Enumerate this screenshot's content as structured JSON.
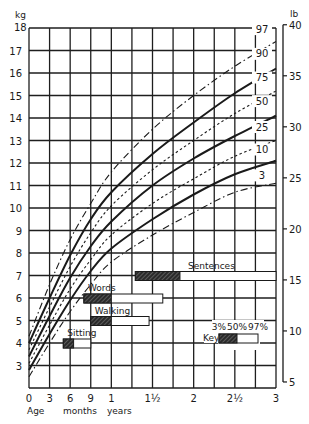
{
  "chart_data": {
    "type": "line",
    "title": "",
    "xlabel": "Age months years",
    "ylabel_left": "kg",
    "ylabel_right": "lb",
    "x_unit": "months",
    "xlim": [
      0,
      36
    ],
    "ylim": [
      2,
      18
    ],
    "grid": true,
    "x_ticks": [
      {
        "month": 0,
        "label": "0"
      },
      {
        "month": 3,
        "label": "3"
      },
      {
        "month": 6,
        "label": "6"
      },
      {
        "month": 9,
        "label": "9"
      },
      {
        "month": 12,
        "label": "1"
      },
      {
        "month": 18,
        "label": "1½"
      },
      {
        "month": 24,
        "label": "2"
      },
      {
        "month": 30,
        "label": "2½"
      },
      {
        "month": 36,
        "label": "3"
      }
    ],
    "x_sublabels": {
      "age": "Age",
      "months": "months",
      "years": "years"
    },
    "y_ticks_left": [
      3,
      4,
      5,
      6,
      7,
      8,
      9,
      10,
      11,
      12,
      13,
      14,
      15,
      16,
      17,
      18
    ],
    "y_ticks_right": [
      5,
      10,
      15,
      20,
      25,
      30,
      35,
      40
    ],
    "x": [
      0,
      3,
      6,
      9,
      12,
      18,
      24,
      30,
      36
    ],
    "series": [
      {
        "name": "97",
        "style": "dashdot",
        "values": [
          4.3,
          6.6,
          8.6,
          10.2,
          11.6,
          13.5,
          15.0,
          16.3,
          17.4
        ]
      },
      {
        "name": "90",
        "style": "solid",
        "values": [
          4.0,
          6.0,
          7.9,
          9.5,
          10.7,
          12.4,
          13.8,
          15.1,
          16.2
        ]
      },
      {
        "name": "75",
        "style": "dotted",
        "values": [
          3.7,
          5.6,
          7.4,
          8.9,
          10.1,
          11.7,
          13.0,
          14.2,
          15.2
        ]
      },
      {
        "name": "50",
        "style": "solid",
        "values": [
          3.4,
          5.2,
          6.9,
          8.3,
          9.4,
          11.0,
          12.2,
          13.2,
          14.1
        ]
      },
      {
        "name": "25",
        "style": "dotted",
        "values": [
          3.1,
          4.8,
          6.4,
          7.7,
          8.8,
          10.2,
          11.3,
          12.3,
          13.0
        ]
      },
      {
        "name": "10",
        "style": "solid",
        "values": [
          2.8,
          4.4,
          5.9,
          7.2,
          8.2,
          9.5,
          10.6,
          11.5,
          12.1
        ]
      },
      {
        "name": "3",
        "style": "dashdot",
        "values": [
          2.5,
          4.0,
          5.4,
          6.6,
          7.6,
          8.8,
          9.8,
          10.7,
          11.1
        ]
      }
    ],
    "milestones": [
      {
        "name": "Sitting",
        "kg_row": 4,
        "p3": 5,
        "p50": 6.5,
        "p97": 9
      },
      {
        "name": "Walking",
        "kg_row": 5,
        "p3": 9,
        "p50": 12,
        "p97": 17.5
      },
      {
        "name": "Words",
        "kg_row": 6,
        "p3": 8,
        "p50": 12,
        "p97": 19.5
      },
      {
        "name": "Sentences",
        "kg_row": 7,
        "p3": 15.5,
        "p50": 22,
        "p97": 36
      }
    ],
    "key": {
      "label": "Key",
      "markers": [
        "3%",
        "50%",
        "97%"
      ]
    }
  },
  "colors": {
    "ink": "#1a1a1a",
    "paper": "#ffffff"
  }
}
